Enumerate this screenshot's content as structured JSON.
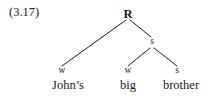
{
  "figure": {
    "example_number": "(3.17)",
    "type": "metrical-tree",
    "background_color": "#ffffff",
    "ink_color": "#1b1b1b"
  },
  "tree": {
    "nodes": [
      {
        "id": "root",
        "label": "R",
        "x": 128,
        "y": 14
      },
      {
        "id": "s-mid",
        "label": "s",
        "x": 152,
        "y": 42
      },
      {
        "id": "leaf-1-mark",
        "label": "w",
        "x": 62,
        "y": 71
      },
      {
        "id": "leaf-2-mark",
        "label": "w",
        "x": 128,
        "y": 71
      },
      {
        "id": "leaf-3-mark",
        "label": "s",
        "x": 177,
        "y": 71
      }
    ],
    "edges": [
      {
        "from": "root",
        "to": "leaf-1-mark",
        "x1": 126,
        "y1": 20,
        "x2": 62,
        "y2": 66
      },
      {
        "from": "root",
        "to": "s-mid",
        "x1": 130,
        "y1": 20,
        "x2": 151,
        "y2": 37
      },
      {
        "from": "s-mid",
        "to": "leaf-2-mark",
        "x1": 150,
        "y1": 48,
        "x2": 128,
        "y2": 66
      },
      {
        "from": "s-mid",
        "to": "leaf-3-mark",
        "x1": 154,
        "y1": 48,
        "x2": 177,
        "y2": 66
      }
    ],
    "leaves": [
      {
        "mark": "w",
        "word": "John’s",
        "x": 68,
        "y": 85
      },
      {
        "mark": "w",
        "word": "big",
        "x": 128,
        "y": 85
      },
      {
        "mark": "s",
        "word": "brother",
        "x": 181,
        "y": 85
      }
    ]
  }
}
